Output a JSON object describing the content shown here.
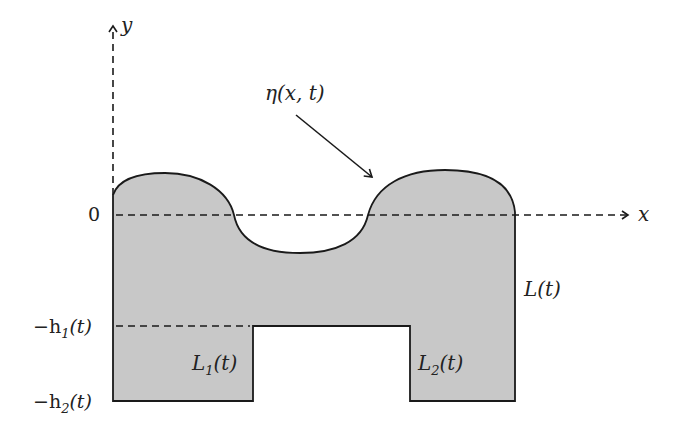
{
  "diagram": {
    "title": "",
    "colors": {
      "fill": "#c8c8c8",
      "stroke": "#1a1a1a",
      "background": "#ffffff"
    },
    "axes": {
      "x_label": "x",
      "y_label": "y",
      "origin_label": "0"
    },
    "levels": {
      "h1_label": "−h₁(t)",
      "h1_minus": "−h",
      "h1_sub": "1",
      "h1_arg": "(t)",
      "h2_minus": "−h",
      "h2_sub": "2",
      "h2_arg": "(t)"
    },
    "annotations": {
      "surface_label": "η(x, t)",
      "surface_eta": "η",
      "surface_args": "(x, t)",
      "length_L": "L",
      "length_L_arg": "(t)",
      "length_L1": "L",
      "length_L1_sub": "1",
      "length_L1_arg": "(t)",
      "length_L2": "L",
      "length_L2_sub": "2",
      "length_L2_arg": "(t)"
    }
  }
}
